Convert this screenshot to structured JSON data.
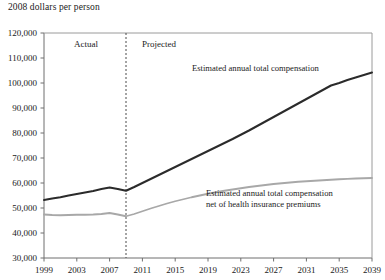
{
  "chart_data": {
    "type": "line",
    "title": "",
    "ylabel": "2008 dollars per person",
    "xlabel": "",
    "grid": false,
    "legend_position": "inline-annotation",
    "xlim": [
      1999,
      2039
    ],
    "ylim": [
      30000,
      120000
    ],
    "ytick_labels": [
      "120,000",
      "110,000",
      "100,000",
      "90,000",
      "80,000",
      "70,000",
      "60,000",
      "50,000",
      "40,000",
      "30,000"
    ],
    "ytick_values": [
      120000,
      110000,
      100000,
      90000,
      80000,
      70000,
      60000,
      50000,
      40000,
      30000
    ],
    "xtick_labels": [
      "1999",
      "2003",
      "2007",
      "2011",
      "2015",
      "2019",
      "2023",
      "2027",
      "2031",
      "2035",
      "2039"
    ],
    "xtick_values": [
      1999,
      2003,
      2007,
      2011,
      2015,
      2019,
      2023,
      2027,
      2031,
      2035,
      2039
    ],
    "divider": {
      "x": 2009,
      "style": "dashed",
      "left_label": "Actual",
      "right_label": "Projected"
    },
    "x": [
      1999,
      2000,
      2001,
      2002,
      2003,
      2004,
      2005,
      2006,
      2007,
      2008,
      2009,
      2010,
      2011,
      2012,
      2013,
      2014,
      2015,
      2016,
      2017,
      2018,
      2019,
      2020,
      2021,
      2022,
      2023,
      2024,
      2025,
      2026,
      2027,
      2028,
      2029,
      2030,
      2031,
      2032,
      2033,
      2034,
      2035,
      2036,
      2037,
      2038,
      2039
    ],
    "series": [
      {
        "name": "Estimated annual total compensation",
        "color": "#2b2b2b",
        "width": 2.0,
        "values": [
          53200,
          53800,
          54300,
          55000,
          55600,
          56200,
          56800,
          57600,
          58200,
          57600,
          56900,
          58400,
          60000,
          61600,
          63200,
          64800,
          66400,
          68000,
          69600,
          71200,
          72800,
          74400,
          76000,
          77600,
          79300,
          81000,
          82800,
          84600,
          86400,
          88200,
          90000,
          91800,
          93600,
          95400,
          97200,
          99000,
          100000,
          101200,
          102200,
          103200,
          104200
        ]
      },
      {
        "name": "Estimated annual total compensation net of health insurance premiums",
        "color": "#a8a8a8",
        "width": 1.8,
        "values": [
          47400,
          47200,
          47100,
          47200,
          47300,
          47300,
          47400,
          47600,
          48000,
          47400,
          46700,
          47600,
          48700,
          49800,
          50800,
          51800,
          52700,
          53500,
          54300,
          55000,
          55700,
          56300,
          56900,
          57400,
          57900,
          58400,
          58800,
          59200,
          59600,
          59900,
          60200,
          60500,
          60700,
          60900,
          61100,
          61300,
          61500,
          61650,
          61800,
          61900,
          62000
        ]
      }
    ],
    "annotations": [
      {
        "id": "upper",
        "text": "Estimated annual total compensation",
        "x_px": 192,
        "y_px": 71
      },
      {
        "id": "lower_line1",
        "text": "Estimated annual total compensation",
        "x_px": 206,
        "y_px": 196
      },
      {
        "id": "lower_line2",
        "text": "net of health insurance premiums",
        "x_px": 206,
        "y_px": 207
      }
    ]
  }
}
